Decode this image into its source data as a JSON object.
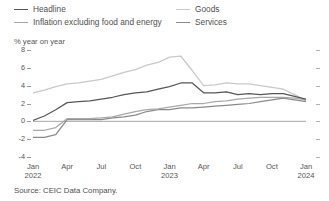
{
  "legend": {
    "items": [
      {
        "label": "Headline",
        "color": "#575757",
        "column": 1,
        "row": 1
      },
      {
        "label": "Goods",
        "color": "#c9c9c9",
        "column": 2,
        "row": 1
      },
      {
        "label": "Inflation excluding food and energy",
        "color": "#a8a8a8",
        "column": 1,
        "row": 2
      },
      {
        "label": "Services",
        "color": "#8a8a8a",
        "column": 2,
        "row": 2
      }
    ]
  },
  "axis_title": "% year on year",
  "source": "Source: CEIC Data Company.",
  "chart_data": {
    "type": "line",
    "title": "",
    "subtitle": "",
    "xlabel": "",
    "ylabel": "% year on year",
    "ylim": [
      -4,
      8
    ],
    "yticks": [
      8,
      6,
      4,
      2,
      0,
      -2,
      -4
    ],
    "ytick_labels": [
      "8",
      "6",
      "4",
      "2",
      "0",
      "-2",
      "-4"
    ],
    "grid": false,
    "zero_line": true,
    "legend_position": "top",
    "x": [
      "Jan 2022",
      "Feb 2022",
      "Mar 2022",
      "Apr 2022",
      "May 2022",
      "Jun 2022",
      "Jul 2022",
      "Aug 2022",
      "Sep 2022",
      "Oct 2022",
      "Nov 2022",
      "Dec 2022",
      "Jan 2023",
      "Feb 2023",
      "Mar 2023",
      "Apr 2023",
      "May 2023",
      "Jun 2023",
      "Jul 2023",
      "Aug 2023",
      "Sep 2023",
      "Oct 2023",
      "Nov 2023",
      "Dec 2023",
      "Jan 2024"
    ],
    "xtick_labels": [
      {
        "month": "Jan",
        "year": "2022",
        "index": 0
      },
      {
        "month": "Apr",
        "year": "",
        "index": 3
      },
      {
        "month": "Jul",
        "year": "",
        "index": 6
      },
      {
        "month": "Oct",
        "year": "",
        "index": 9
      },
      {
        "month": "Jan",
        "year": "2023",
        "index": 12
      },
      {
        "month": "Apr",
        "year": "",
        "index": 15
      },
      {
        "month": "Jul",
        "year": "",
        "index": 18
      },
      {
        "month": "Oct",
        "year": "",
        "index": 21
      },
      {
        "month": "Jan",
        "year": "2024",
        "index": 24
      }
    ],
    "series": [
      {
        "name": "Headline",
        "color": "#575757",
        "values": [
          0.1,
          0.6,
          1.3,
          2.1,
          2.2,
          2.3,
          2.5,
          2.7,
          3.0,
          3.2,
          3.3,
          3.6,
          3.9,
          4.3,
          4.3,
          3.2,
          3.2,
          3.3,
          3.0,
          3.1,
          3.0,
          3.1,
          3.1,
          2.8,
          2.5
        ]
      },
      {
        "name": "Inflation excluding food and energy",
        "color": "#a8a8a8",
        "values": [
          -1.0,
          -1.0,
          -0.7,
          0.3,
          0.3,
          0.3,
          0.4,
          0.5,
          0.8,
          1.1,
          1.3,
          1.4,
          1.6,
          1.8,
          2.0,
          2.0,
          2.2,
          2.3,
          2.5,
          2.6,
          2.7,
          2.7,
          2.7,
          2.6,
          2.4
        ]
      },
      {
        "name": "Goods",
        "color": "#c9c9c9",
        "values": [
          3.2,
          3.5,
          3.9,
          4.2,
          4.3,
          4.5,
          4.7,
          5.1,
          5.5,
          5.8,
          6.3,
          6.6,
          7.2,
          7.3,
          5.7,
          4.0,
          4.1,
          4.3,
          4.2,
          4.2,
          4.0,
          3.8,
          3.6,
          3.0,
          2.3
        ]
      },
      {
        "name": "Services",
        "color": "#8a8a8a",
        "values": [
          -1.8,
          -1.8,
          -1.5,
          0.2,
          0.2,
          0.2,
          0.2,
          0.4,
          0.5,
          0.7,
          1.1,
          1.3,
          1.3,
          1.5,
          1.5,
          1.6,
          1.7,
          1.8,
          1.9,
          2.0,
          2.2,
          2.4,
          2.6,
          2.4,
          2.2
        ]
      }
    ]
  }
}
